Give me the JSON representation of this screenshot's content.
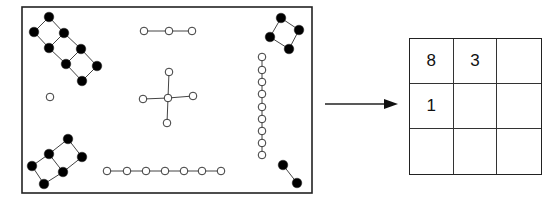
{
  "diagram": {
    "colors": {
      "stroke": "#222222",
      "filled_node": "#000000",
      "open_node": "#ffffff",
      "edge": "#444444"
    },
    "image_frame": {
      "x": 22,
      "y": 7,
      "width": 290,
      "height": 186
    },
    "components": [
      {
        "id": "ladder-8",
        "fill": "black",
        "nodes": [
          [
            49,
            17
          ],
          [
            34,
            32
          ],
          [
            64,
            33
          ],
          [
            49,
            48
          ],
          [
            81,
            49
          ],
          [
            66,
            64
          ],
          [
            97,
            66
          ],
          [
            82,
            81
          ]
        ],
        "edges": [
          [
            0,
            1
          ],
          [
            0,
            2
          ],
          [
            1,
            3
          ],
          [
            2,
            3
          ],
          [
            2,
            4
          ],
          [
            3,
            5
          ],
          [
            4,
            5
          ],
          [
            4,
            6
          ],
          [
            5,
            7
          ],
          [
            6,
            7
          ]
        ]
      },
      {
        "id": "ladder-6",
        "fill": "black",
        "nodes": [
          [
            68,
            139
          ],
          [
            49,
            154
          ],
          [
            82,
            157
          ],
          [
            32,
            166
          ],
          [
            63,
            172
          ],
          [
            44,
            184
          ]
        ],
        "edges": [
          [
            0,
            1
          ],
          [
            0,
            2
          ],
          [
            1,
            3
          ],
          [
            1,
            4
          ],
          [
            2,
            4
          ],
          [
            3,
            5
          ],
          [
            4,
            5
          ]
        ]
      },
      {
        "id": "square-4",
        "fill": "black",
        "nodes": [
          [
            281,
            18
          ],
          [
            299,
            30
          ],
          [
            270,
            37
          ],
          [
            289,
            49
          ]
        ],
        "edges": [
          [
            0,
            1
          ],
          [
            0,
            2
          ],
          [
            1,
            3
          ],
          [
            2,
            3
          ]
        ]
      },
      {
        "id": "pair-2",
        "fill": "black",
        "nodes": [
          [
            283,
            165
          ],
          [
            297,
            183
          ]
        ],
        "edges": [
          [
            0,
            1
          ]
        ]
      },
      {
        "id": "chain-3",
        "fill": "white",
        "nodes": [
          [
            144,
            31
          ],
          [
            169,
            31
          ],
          [
            192,
            31
          ]
        ],
        "edges": [
          [
            0,
            1
          ],
          [
            1,
            2
          ]
        ]
      },
      {
        "id": "star-5",
        "fill": "white",
        "nodes": [
          [
            168,
            98
          ],
          [
            169,
            72
          ],
          [
            143,
            99
          ],
          [
            193,
            96
          ],
          [
            167,
            123
          ]
        ],
        "edges": [
          [
            0,
            1
          ],
          [
            0,
            2
          ],
          [
            0,
            3
          ],
          [
            0,
            4
          ]
        ]
      },
      {
        "id": "chain-7",
        "fill": "white",
        "nodes": [
          [
            107,
            171
          ],
          [
            127,
            171
          ],
          [
            146,
            171
          ],
          [
            165,
            171
          ],
          [
            184,
            171
          ],
          [
            202,
            171
          ],
          [
            221,
            171
          ]
        ],
        "edges": [
          [
            0,
            1
          ],
          [
            1,
            2
          ],
          [
            2,
            3
          ],
          [
            3,
            4
          ],
          [
            4,
            5
          ],
          [
            5,
            6
          ]
        ]
      },
      {
        "id": "chain-9-vertical",
        "fill": "white",
        "nodes": [
          [
            262,
            57
          ],
          [
            262,
            70
          ],
          [
            262,
            82
          ],
          [
            262,
            94
          ],
          [
            262,
            107
          ],
          [
            262,
            119
          ],
          [
            262,
            131
          ],
          [
            262,
            143
          ],
          [
            262,
            155
          ]
        ],
        "edges": [
          [
            0,
            1
          ],
          [
            1,
            2
          ],
          [
            2,
            3
          ],
          [
            3,
            4
          ],
          [
            4,
            5
          ],
          [
            5,
            6
          ],
          [
            6,
            7
          ],
          [
            7,
            8
          ]
        ]
      },
      {
        "id": "isolated-1",
        "fill": "white",
        "nodes": [
          [
            50,
            97
          ]
        ],
        "edges": []
      }
    ],
    "arrow": {
      "x1": 325,
      "y1": 104,
      "x2": 398,
      "y2": 104
    },
    "grid": {
      "rows": 3,
      "cols": 3,
      "cells": [
        "8",
        "3",
        "",
        "1",
        "",
        "",
        "",
        "",
        ""
      ]
    }
  }
}
